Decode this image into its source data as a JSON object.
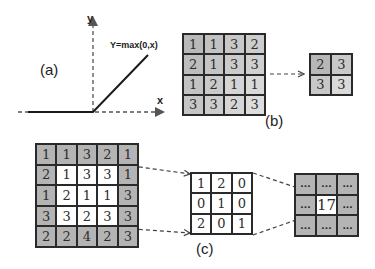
{
  "panel_a": {
    "label": "(a)",
    "x_axis_label": "x",
    "y_axis_label": "y",
    "function_label": "Y=max(0,x)"
  },
  "panel_b": {
    "label": "(b)",
    "input_grid": [
      [
        "1",
        "1",
        "3",
        "2"
      ],
      [
        "2",
        "1",
        "3",
        "3"
      ],
      [
        "1",
        "2",
        "1",
        "1"
      ],
      [
        "3",
        "3",
        "2",
        "3"
      ]
    ],
    "input_shades": [
      [
        "#b9b9b9",
        "#c2c2c2",
        "#c8c8c8",
        "#cdcdcd"
      ],
      [
        "#bdbdbd",
        "#c4c4c4",
        "#cbcbcb",
        "#d0d0d0"
      ],
      [
        "#c3c3c3",
        "#cacaca",
        "#d4d4d4",
        "#d9d9d9"
      ],
      [
        "#c6c6c6",
        "#cdcdcd",
        "#d6d6d6",
        "#dddddd"
      ]
    ],
    "output_grid": [
      [
        "2",
        "3"
      ],
      [
        "3",
        "3"
      ]
    ],
    "output_shades": [
      [
        "#b7b7b7",
        "#c9c9c9"
      ],
      [
        "#c7c7c7",
        "#dadada"
      ]
    ]
  },
  "panel_c": {
    "label": "(c)",
    "input_grid": [
      [
        "1",
        "1",
        "3",
        "2",
        "1"
      ],
      [
        "2",
        "1",
        "3",
        "3",
        "1"
      ],
      [
        "1",
        "2",
        "1",
        "1",
        "3"
      ],
      [
        "3",
        "3",
        "2",
        "3",
        "3"
      ],
      [
        "2",
        "2",
        "4",
        "2",
        "3"
      ]
    ],
    "kernel": [
      [
        "1",
        "2",
        "0"
      ],
      [
        "0",
        "1",
        "0"
      ],
      [
        "2",
        "0",
        "1"
      ]
    ],
    "output_grid": [
      [
        "...",
        "...",
        "..."
      ],
      [
        "...",
        "17",
        "..."
      ],
      [
        "...",
        "...",
        "..."
      ]
    ],
    "output_center_value": "17"
  },
  "colors": {
    "border": "#2a2a2a",
    "gray_cell": "#b4b4b4",
    "white_cell": "#ffffff",
    "line": "#222222",
    "dash": "#555555"
  }
}
